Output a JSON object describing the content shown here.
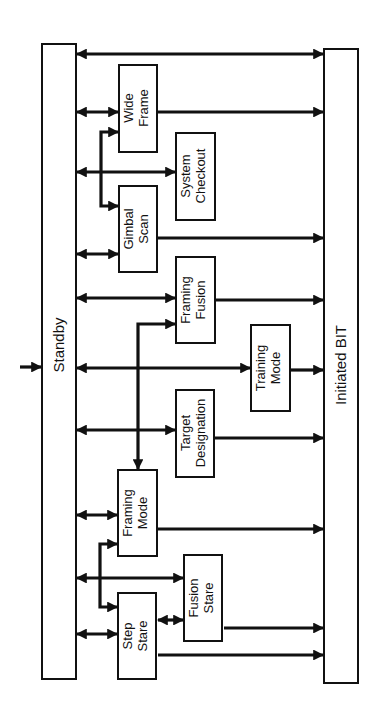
{
  "diagram": {
    "title": "",
    "nodes": {
      "standby": {
        "label": "Standby"
      },
      "initiated_bit": {
        "label": "Initiated BIT"
      },
      "wide_frame": {
        "line1": "Wide",
        "line2": "Frame"
      },
      "system_checkout": {
        "line1": "System",
        "line2": "Checkout"
      },
      "gimbal_scan": {
        "line1": "Gimbal",
        "line2": "Scan"
      },
      "framing_fusion": {
        "line1": "Framing",
        "line2": "Fusion"
      },
      "training_mode": {
        "line1": "Training",
        "line2": "Mode"
      },
      "target_designation": {
        "line1": "Target",
        "line2": "Designation"
      },
      "framing_mode": {
        "line1": "Framing",
        "line2": "Mode"
      },
      "fusion_stare": {
        "line1": "Fusion",
        "line2": "Stare"
      },
      "step_stare": {
        "line1": "Step",
        "line2": "Stare"
      }
    },
    "edges": [
      {
        "from": "entry",
        "to": "Standby",
        "type": "one-way"
      },
      {
        "from": "Standby",
        "to": "Initiated BIT",
        "type": "two-way"
      },
      {
        "from": "Standby",
        "to": "Wide Frame",
        "type": "two-way"
      },
      {
        "from": "Standby",
        "to": "System Checkout",
        "type": "two-way"
      },
      {
        "from": "Standby",
        "to": "Gimbal Scan",
        "type": "two-way"
      },
      {
        "from": "Standby",
        "to": "Framing Fusion",
        "type": "two-way"
      },
      {
        "from": "Standby",
        "to": "Training Mode",
        "type": "two-way"
      },
      {
        "from": "Standby",
        "to": "Target Designation",
        "type": "two-way"
      },
      {
        "from": "Standby",
        "to": "Framing Mode",
        "type": "two-way"
      },
      {
        "from": "Standby",
        "to": "Fusion Stare",
        "type": "two-way"
      },
      {
        "from": "Standby",
        "to": "Step Stare",
        "type": "two-way"
      },
      {
        "from": "Gimbal Scan",
        "to": "Wide Frame",
        "type": "two-way"
      },
      {
        "from": "Framing Fusion",
        "to": "Framing Mode",
        "type": "two-way"
      },
      {
        "from": "Step Stare",
        "to": "Framing Mode",
        "type": "two-way"
      },
      {
        "from": "Step Stare",
        "to": "Fusion Stare",
        "type": "two-way"
      },
      {
        "from": "Wide Frame",
        "to": "Initiated BIT",
        "type": "one-way"
      },
      {
        "from": "Gimbal Scan",
        "to": "Initiated BIT",
        "type": "one-way"
      },
      {
        "from": "Framing Fusion",
        "to": "Initiated BIT",
        "type": "one-way"
      },
      {
        "from": "Training Mode",
        "to": "Initiated BIT",
        "type": "one-way"
      },
      {
        "from": "Target Designation",
        "to": "Initiated BIT",
        "type": "one-way"
      },
      {
        "from": "Framing Mode",
        "to": "Initiated BIT",
        "type": "one-way"
      },
      {
        "from": "Fusion Stare",
        "to": "Initiated BIT",
        "type": "one-way"
      },
      {
        "from": "Step Stare",
        "to": "Initiated BIT",
        "type": "one-way"
      }
    ]
  }
}
